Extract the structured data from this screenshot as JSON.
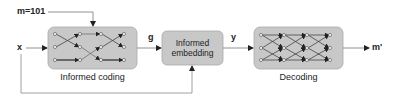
{
  "diagram": {
    "message_label": "m=101",
    "input_label": "x",
    "coded_label": "g",
    "embedded_label": "y",
    "output_label": "m'",
    "blocks": {
      "informed_coding": {
        "caption": "Informed coding"
      },
      "informed_embedding": {
        "line1": "Informed",
        "line2": "embedding"
      },
      "decoding": {
        "caption": "Decoding"
      }
    },
    "colors": {
      "block_fill": "#c8c8c8",
      "block_stroke": "#a0a0a0",
      "line": "#555555",
      "arrow": "#222222"
    }
  }
}
